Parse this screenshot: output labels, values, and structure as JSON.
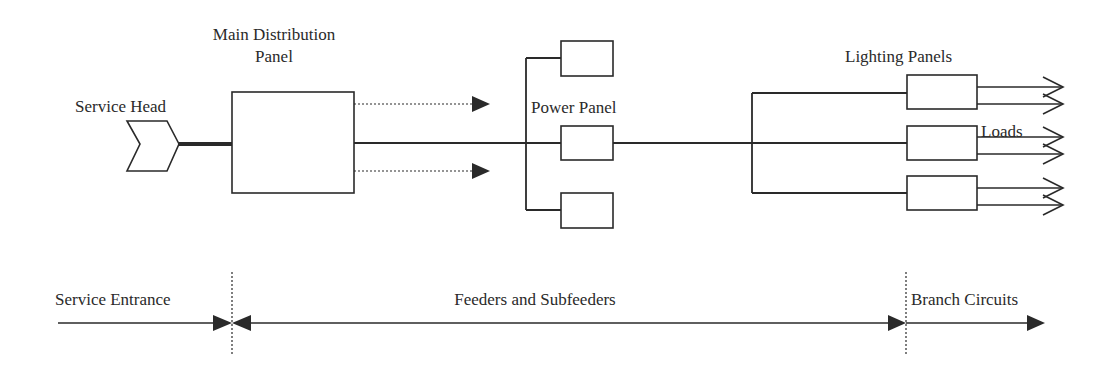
{
  "diagram": {
    "colors": {
      "line": "#2a2a2a",
      "background": "#ffffff"
    },
    "labels": {
      "main_distribution_line1": "Main Distribution",
      "main_distribution_line2": "Panel",
      "service_head": "Service Head",
      "power_panel": "Power Panel",
      "lighting_panels": "Lighting  Panels",
      "loads": "Loads"
    },
    "zones": {
      "service_entrance": "Service Entrance",
      "feeders": "Feeders and Subfeeders",
      "branch_circuits": "Branch Circuits"
    },
    "nodes": [
      {
        "id": "service-head",
        "label": "Service Head",
        "shape": "chevron"
      },
      {
        "id": "main-distribution-panel",
        "label": "Main Distribution Panel",
        "shape": "rect"
      },
      {
        "id": "power-panel-top",
        "shape": "rect"
      },
      {
        "id": "power-panel",
        "label": "Power Panel",
        "shape": "rect"
      },
      {
        "id": "power-panel-bottom",
        "shape": "rect"
      },
      {
        "id": "lighting-panel-1",
        "shape": "rect"
      },
      {
        "id": "lighting-panel-2",
        "shape": "rect"
      },
      {
        "id": "lighting-panel-3",
        "shape": "rect"
      },
      {
        "id": "loads",
        "label": "Loads",
        "shape": "open-arrows"
      }
    ],
    "edges": [
      {
        "from": "service-head",
        "to": "main-distribution-panel",
        "style": "thick"
      },
      {
        "from": "main-distribution-panel",
        "to": "power-panel-bus",
        "style": "solid"
      },
      {
        "from": "main-distribution-panel",
        "to": "other-feeders-1",
        "style": "dotted-arrow"
      },
      {
        "from": "main-distribution-panel",
        "to": "other-feeders-2",
        "style": "dotted-arrow"
      },
      {
        "from": "power-panel",
        "to": "lighting-bus",
        "style": "solid"
      },
      {
        "from": "lighting-bus",
        "to": "lighting-panel-1",
        "style": "solid"
      },
      {
        "from": "lighting-bus",
        "to": "lighting-panel-2",
        "style": "solid"
      },
      {
        "from": "lighting-bus",
        "to": "lighting-panel-3",
        "style": "solid"
      },
      {
        "from": "lighting-panel-1",
        "to": "loads",
        "style": "solid",
        "count": 2
      },
      {
        "from": "lighting-panel-2",
        "to": "loads",
        "style": "solid",
        "count": 2
      },
      {
        "from": "lighting-panel-3",
        "to": "loads",
        "style": "solid",
        "count": 2
      }
    ]
  }
}
